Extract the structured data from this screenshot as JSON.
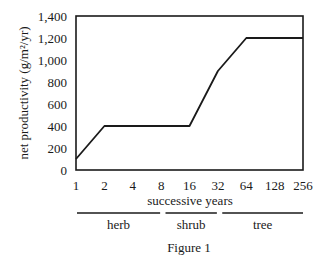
{
  "chart_data": {
    "type": "line",
    "title": "",
    "caption": "Figure 1",
    "xlabel": "successive years",
    "ylabel": "net productivity (g/m²/yr)",
    "x_scale": "log2",
    "categories": [
      "1",
      "2",
      "4",
      "8",
      "16",
      "32",
      "64",
      "128",
      "256"
    ],
    "yticks": [
      "0",
      "200",
      "400",
      "600",
      "800",
      "1,000",
      "1,200",
      "1,400"
    ],
    "ylim": [
      0,
      1400
    ],
    "grid": false,
    "legend": null,
    "series": [
      {
        "name": "net productivity",
        "points": [
          {
            "x": 1,
            "y": 100
          },
          {
            "x": 2,
            "y": 400
          },
          {
            "x": 16,
            "y": 400
          },
          {
            "x": 32,
            "y": 900
          },
          {
            "x": 64,
            "y": 1200
          },
          {
            "x": 256,
            "y": 1200
          }
        ]
      }
    ],
    "stages": [
      {
        "label": "herb",
        "from": 1,
        "to": 8
      },
      {
        "label": "shrub",
        "from": 16,
        "to": 32
      },
      {
        "label": "tree",
        "from": 64,
        "to": 256
      }
    ]
  },
  "colors": {
    "line": "#1a1a1a",
    "frame": "#1a1a1a",
    "text": "#1a1a1a",
    "background": "#ffffff"
  }
}
